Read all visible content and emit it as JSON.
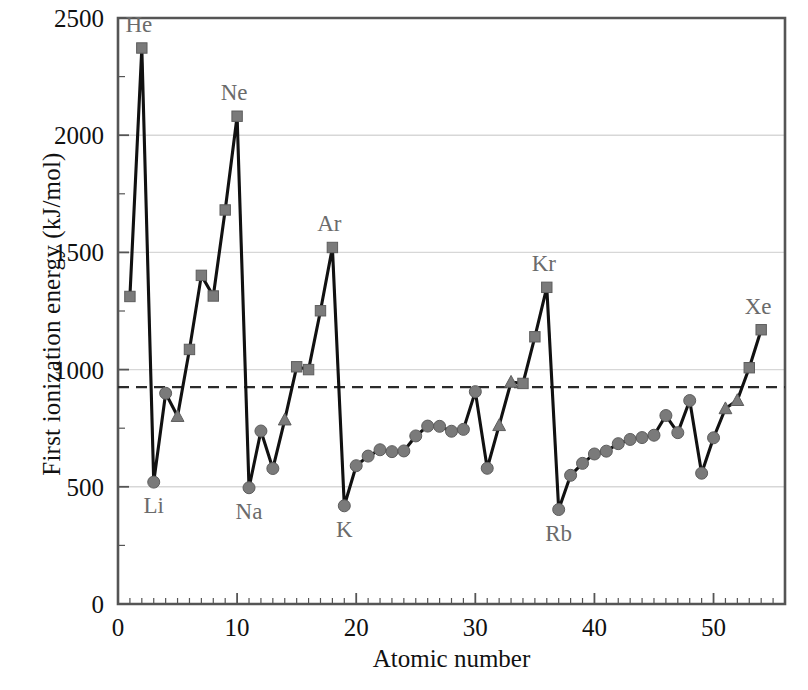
{
  "chart_data": {
    "type": "line",
    "title": "",
    "xlabel": "Atomic number",
    "ylabel": "First ionization energy (kJ/mol)",
    "xlim": [
      0,
      56
    ],
    "ylim": [
      0,
      2500
    ],
    "xticks": [
      0,
      10,
      20,
      30,
      40,
      50
    ],
    "yticks": [
      0,
      500,
      1000,
      1500,
      2000,
      2500
    ],
    "xtick_labels": [
      "0",
      "10",
      "20",
      "30",
      "40",
      "50"
    ],
    "ytick_labels": [
      "0",
      "500",
      "1000",
      "1500",
      "2000",
      "2500"
    ],
    "minor_xtick_step": 1,
    "minor_ytick_step": 250,
    "grid": "horizontal-major",
    "legend": "none",
    "reference_line": {
      "orientation": "horizontal",
      "value": 925,
      "style": "dashed",
      "label": ""
    },
    "marker_shapes": {
      "square": "nonmetal",
      "circle": "metal",
      "triangle": "metalloid"
    },
    "series": [
      {
        "name": "First ionization energy",
        "x": [
          1,
          2,
          3,
          4,
          5,
          6,
          7,
          8,
          9,
          10,
          11,
          12,
          13,
          14,
          15,
          16,
          17,
          18,
          19,
          20,
          21,
          22,
          23,
          24,
          25,
          26,
          27,
          28,
          29,
          30,
          31,
          32,
          33,
          34,
          35,
          36,
          37,
          38,
          39,
          40,
          41,
          42,
          43,
          44,
          45,
          46,
          47,
          48,
          49,
          50,
          51,
          52,
          53,
          54
        ],
        "symbols": [
          "H",
          "He",
          "Li",
          "Be",
          "B",
          "C",
          "N",
          "O",
          "F",
          "Ne",
          "Na",
          "Mg",
          "Al",
          "Si",
          "P",
          "S",
          "Cl",
          "Ar",
          "K",
          "Ca",
          "Sc",
          "Ti",
          "V",
          "Cr",
          "Mn",
          "Fe",
          "Co",
          "Ni",
          "Cu",
          "Zn",
          "Ga",
          "Ge",
          "As",
          "Se",
          "Br",
          "Kr",
          "Rb",
          "Sr",
          "Y",
          "Zr",
          "Nb",
          "Mo",
          "Tc",
          "Ru",
          "Rh",
          "Pd",
          "Ag",
          "Cd",
          "In",
          "Sn",
          "Sb",
          "Te",
          "I",
          "Xe"
        ],
        "values": [
          1312,
          2372,
          520,
          899,
          801,
          1086,
          1402,
          1314,
          1681,
          2081,
          496,
          738,
          578,
          786,
          1012,
          1000,
          1251,
          1521,
          419,
          590,
          631,
          658,
          650,
          653,
          717,
          759,
          758,
          737,
          745,
          906,
          579,
          762,
          947,
          941,
          1140,
          1351,
          403,
          549,
          600,
          640,
          652,
          684,
          702,
          710,
          720,
          804,
          731,
          868,
          558,
          709,
          834,
          869,
          1008,
          1170
        ],
        "marker": [
          "square",
          "square",
          "circle",
          "circle",
          "triangle",
          "square",
          "square",
          "square",
          "square",
          "square",
          "circle",
          "circle",
          "circle",
          "triangle",
          "square",
          "square",
          "square",
          "square",
          "circle",
          "circle",
          "circle",
          "circle",
          "circle",
          "circle",
          "circle",
          "circle",
          "circle",
          "circle",
          "circle",
          "circle",
          "circle",
          "triangle",
          "triangle",
          "square",
          "square",
          "square",
          "circle",
          "circle",
          "circle",
          "circle",
          "circle",
          "circle",
          "circle",
          "circle",
          "circle",
          "circle",
          "circle",
          "circle",
          "circle",
          "circle",
          "triangle",
          "triangle",
          "square",
          "square"
        ]
      }
    ],
    "annotations": [
      {
        "text": "He",
        "x": 2,
        "value": 2372,
        "placement": "above-left"
      },
      {
        "text": "Ne",
        "x": 10,
        "value": 2081,
        "placement": "above-left"
      },
      {
        "text": "Ar",
        "x": 18,
        "value": 1521,
        "placement": "above-left"
      },
      {
        "text": "Kr",
        "x": 36,
        "value": 1351,
        "placement": "above-left"
      },
      {
        "text": "Xe",
        "x": 54,
        "value": 1170,
        "placement": "above-left"
      },
      {
        "text": "Li",
        "x": 3,
        "value": 520,
        "placement": "below"
      },
      {
        "text": "Na",
        "x": 11,
        "value": 496,
        "placement": "below"
      },
      {
        "text": "K",
        "x": 19,
        "value": 419,
        "placement": "below"
      },
      {
        "text": "Rb",
        "x": 37,
        "value": 403,
        "placement": "below"
      }
    ],
    "drop_lines": [
      {
        "from_symbol": "He",
        "from_x": 2,
        "from_value": 2372,
        "to_symbol": "Li",
        "to_x": 3,
        "to_value": 520
      },
      {
        "from_symbol": "Ne",
        "from_x": 10,
        "from_value": 2081,
        "to_symbol": "Na",
        "to_x": 11,
        "to_value": 496
      },
      {
        "from_symbol": "Ar",
        "from_x": 18,
        "from_value": 1521,
        "to_symbol": "K",
        "to_x": 19,
        "to_value": 419
      },
      {
        "from_symbol": "Kr",
        "from_x": 36,
        "from_value": 1351,
        "to_symbol": "Rb",
        "to_x": 37,
        "to_value": 403
      }
    ],
    "colors": {
      "line": "#111111",
      "marker": "#7a7a7a",
      "marker_edge": "#5d5d5d",
      "grid": "#d7d7d7",
      "axis": "#555555",
      "annotation": "#6b6b6b",
      "reference_line": "#2b2b2b",
      "background": "#ffffff"
    }
  },
  "axes": {
    "x_title": "Atomic number",
    "y_title": "First ionization energy (kJ/mol)"
  }
}
